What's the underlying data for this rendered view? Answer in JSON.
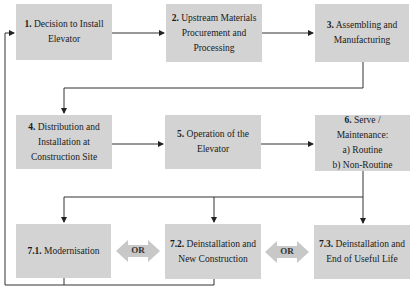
{
  "diagram": {
    "steps": [
      {
        "id": "1",
        "num": "1.",
        "lines": [
          "Decision to Install",
          "Elevator"
        ]
      },
      {
        "id": "2",
        "num": "2.",
        "lines": [
          "Upstream Materials",
          "Procurement and",
          "Processing"
        ]
      },
      {
        "id": "3",
        "num": "3.",
        "lines": [
          "Assembling and",
          "Manufacturing"
        ]
      },
      {
        "id": "4",
        "num": "4.",
        "lines": [
          "Distribution and",
          "Installation at",
          "Construction Site"
        ]
      },
      {
        "id": "5",
        "num": "5.",
        "lines": [
          "Operation of the",
          "Elevator"
        ]
      },
      {
        "id": "6",
        "num": "6.",
        "lines": [
          "Serve / Maintenance:",
          "a) Routine",
          "b) Non-Routine"
        ]
      },
      {
        "id": "7.1",
        "num": "7.1.",
        "lines": [
          "Modernisation"
        ]
      },
      {
        "id": "7.2",
        "num": "7.2.",
        "lines": [
          "Deinstallation and",
          "New Construction"
        ]
      },
      {
        "id": "7.3",
        "num": "7.3.",
        "lines": [
          "Deinstallation and",
          "End of Useful Life"
        ]
      }
    ],
    "connectors": [
      {
        "label": "OR",
        "between": [
          "7.1",
          "7.2"
        ]
      },
      {
        "label": "OR",
        "between": [
          "7.2",
          "7.3"
        ]
      }
    ],
    "colors": {
      "box_fill": "#d3d3d3",
      "arrow_fill": "#c8c8c8",
      "line": "#333333"
    }
  }
}
